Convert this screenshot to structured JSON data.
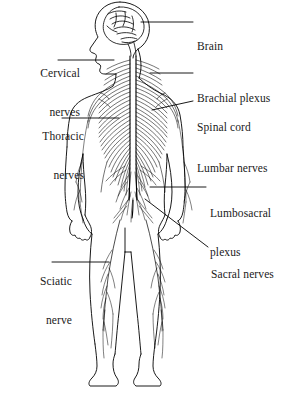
{
  "figure": {
    "view": "posterior full-body schematic",
    "background_color": "#ffffff",
    "ink_color": "#000000",
    "text_color": "#1a1a1a"
  },
  "labels": [
    {
      "id": "brain",
      "text": "Brain",
      "lines": [
        "Brain"
      ],
      "side": "right",
      "x": 197,
      "y": 14,
      "leader": {
        "type": "straight",
        "x1": 141,
        "y1": 22,
        "x2": 193,
        "y2": 22
      }
    },
    {
      "id": "cervical-nerves",
      "text": "Cervical nerves",
      "lines": [
        "Cervical",
        "nerves"
      ],
      "side": "left",
      "x": 8,
      "y": 41,
      "leader": {
        "type": "straight",
        "x1": 58,
        "y1": 60,
        "x2": 114,
        "y2": 60
      }
    },
    {
      "id": "brachial-plexus",
      "text": "Brachial plexus",
      "lines": [
        "Brachial plexus"
      ],
      "side": "right",
      "x": 197,
      "y": 66,
      "leader": {
        "type": "straight",
        "x1": 150,
        "y1": 73,
        "x2": 193,
        "y2": 73
      }
    },
    {
      "id": "spinal-cord",
      "text": "Spinal cord",
      "lines": [
        "Spinal cord"
      ],
      "side": "right",
      "x": 197,
      "y": 95,
      "leader": {
        "type": "straight",
        "x1": 152,
        "y1": 110,
        "x2": 193,
        "y2": 101
      }
    },
    {
      "id": "thoracic-nerves",
      "text": "Thoracic nerves",
      "lines": [
        "Thoracic",
        "nerves"
      ],
      "side": "left",
      "x": 8,
      "y": 104,
      "leader": {
        "type": "straight",
        "x1": 62,
        "y1": 118,
        "x2": 119,
        "y2": 118
      }
    },
    {
      "id": "lumbar-nerves",
      "text": "Lumbar nerves",
      "lines": [
        "Lumbar nerves"
      ],
      "side": "right",
      "x": 197,
      "y": 136,
      "leader": null
    },
    {
      "id": "lumbosacral-plexus",
      "text": "Lumbosacral plexus",
      "lines": [
        "Lumbosacral",
        "plexus"
      ],
      "side": "right",
      "x": 210,
      "y": 181,
      "leader": {
        "type": "straight",
        "x1": 150,
        "y1": 187,
        "x2": 206,
        "y2": 187
      }
    },
    {
      "id": "sacral-nerves",
      "text": "Sacral nerves",
      "lines": [
        "Sacral nerves"
      ],
      "side": "right",
      "x": 211,
      "y": 242,
      "leader": {
        "type": "diagonal",
        "x1": 145,
        "y1": 199,
        "x2": 208,
        "y2": 247
      }
    },
    {
      "id": "sciatic-nerve",
      "text": "Sciatic nerve",
      "lines": [
        "Sciatic",
        "nerve"
      ],
      "side": "left",
      "x": 8,
      "y": 249,
      "leader": {
        "type": "straight",
        "x1": 52,
        "y1": 262,
        "x2": 109,
        "y2": 262
      }
    }
  ],
  "anatomy_parts": [
    {
      "id": "brain-outline",
      "name": "brain"
    },
    {
      "id": "head-profile",
      "name": "head"
    },
    {
      "id": "spinal-cord-column",
      "name": "spinal cord"
    },
    {
      "id": "cervical-nerve-roots",
      "name": "cervical nerves"
    },
    {
      "id": "brachial-plexus-web",
      "name": "brachial plexus"
    },
    {
      "id": "thoracic-nerve-rays",
      "name": "thoracic nerves"
    },
    {
      "id": "lumbar-nerve-rays",
      "name": "lumbar nerves"
    },
    {
      "id": "lumbosacral-plexus-web",
      "name": "lumbosacral plexus"
    },
    {
      "id": "sacral-nerve-rays",
      "name": "sacral nerves"
    },
    {
      "id": "sciatic-nerve-trunk",
      "name": "sciatic nerve"
    },
    {
      "id": "body-outline",
      "name": "body silhouette"
    }
  ]
}
